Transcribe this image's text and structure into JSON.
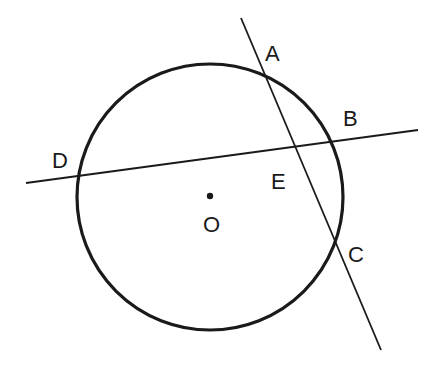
{
  "diagram": {
    "type": "geometry",
    "circle": {
      "center_label": "O",
      "cx": 210,
      "cy": 197,
      "r": 133
    },
    "lines": [
      {
        "name": "secant-AC",
        "through": [
          "A",
          "E",
          "C"
        ],
        "x1": 241,
        "y1": 18,
        "x2": 381,
        "y2": 350
      },
      {
        "name": "secant-DB",
        "through": [
          "D",
          "E",
          "B"
        ],
        "x1": 26,
        "y1": 183,
        "x2": 418,
        "y2": 130
      }
    ],
    "points": {
      "A": {
        "label": "A",
        "x": 263,
        "y": 72
      },
      "B": {
        "label": "B",
        "x": 331,
        "y": 143
      },
      "C": {
        "label": "C",
        "x": 334,
        "y": 238
      },
      "D": {
        "label": "D",
        "x": 80,
        "y": 175
      },
      "E": {
        "label": "E",
        "x": 296,
        "y": 146
      },
      "O": {
        "label": "O",
        "x": 210,
        "y": 196
      }
    },
    "label_positions": {
      "A": {
        "x": 265,
        "y": 61
      },
      "B": {
        "x": 343,
        "y": 126
      },
      "C": {
        "x": 348,
        "y": 262
      },
      "D": {
        "x": 52,
        "y": 168
      },
      "E": {
        "x": 271,
        "y": 189
      },
      "O": {
        "x": 203,
        "y": 232
      }
    },
    "colors": {
      "stroke": "#1a1a1a",
      "background": "#ffffff"
    }
  }
}
